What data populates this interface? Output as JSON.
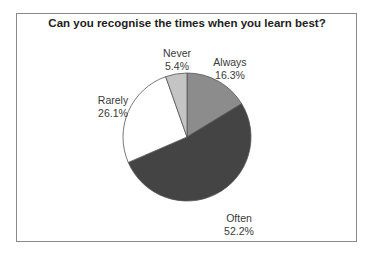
{
  "chart_data": {
    "type": "pie",
    "title": "Can you recognise the times when you learn best?",
    "categories": [
      "Always",
      "Often",
      "Rarely",
      "Never"
    ],
    "values": [
      16.3,
      52.2,
      26.1,
      5.4
    ],
    "labels": [
      {
        "name": "Always",
        "pct": "16.3%"
      },
      {
        "name": "Often",
        "pct": "52.2%"
      },
      {
        "name": "Rarely",
        "pct": "26.1%"
      },
      {
        "name": "Never",
        "pct": "5.4%"
      }
    ],
    "colors": [
      "#8c8c8c",
      "#444444",
      "#ffffff",
      "#c4c4c4"
    ],
    "start_angle": "12 o'clock, clockwise",
    "legend": "none (direct labels)"
  }
}
